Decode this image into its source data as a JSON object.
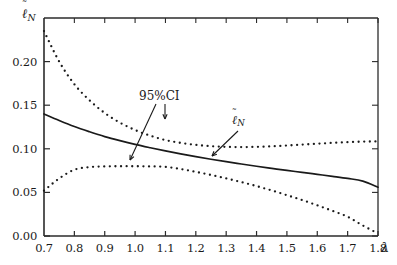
{
  "figure": {
    "background_color": "#ffffff",
    "axis_color": "#2b2b2b",
    "curve_color": "#1a1a1a"
  },
  "axes": {
    "x": {
      "name": "λ",
      "min": 0.7,
      "max": 1.8,
      "tick_values": [
        0.7,
        0.8,
        0.9,
        1.0,
        1.1,
        1.2,
        1.3,
        1.4,
        1.5,
        1.6,
        1.7,
        1.8
      ],
      "tick_labels": [
        "0.7",
        "0.8",
        "0.9",
        "1.0",
        "1.1",
        "1.2",
        "1.3",
        "1.4",
        "1.5",
        "1.6",
        "1.7",
        "1.8"
      ]
    },
    "y": {
      "name_ell": "ℓ",
      "name_tilde": "˜",
      "name_sub": "N",
      "min": 0.0,
      "max": 0.25,
      "tick_values": [
        0.0,
        0.05,
        0.1,
        0.15,
        0.2
      ],
      "tick_labels": [
        "0.00",
        "0.05",
        "0.10",
        "0.15",
        "0.20"
      ]
    }
  },
  "annotations": {
    "ci": {
      "text": "95%CI",
      "x_px": 139,
      "y_px": 89
    },
    "ell": {
      "ell": "ℓ",
      "tilde": "˜",
      "sub": "N",
      "x_px": 232,
      "y_px": 113
    }
  },
  "chart_data": {
    "type": "line",
    "title": "",
    "xlabel": "λ",
    "ylabel": "ℓ̃_N",
    "xlim": [
      0.7,
      1.8
    ],
    "ylim": [
      0.0,
      0.25
    ],
    "grid": false,
    "legend": "annotated in-plot",
    "x": [
      0.7,
      0.75,
      0.8,
      0.85,
      0.9,
      0.95,
      1.0,
      1.05,
      1.1,
      1.15,
      1.2,
      1.25,
      1.3,
      1.35,
      1.4,
      1.45,
      1.5,
      1.55,
      1.6,
      1.65,
      1.7,
      1.75,
      1.8
    ],
    "series": [
      {
        "name": "ℓ̃_N (estimate)",
        "style": "solid",
        "values": [
          0.14,
          0.1325,
          0.1255,
          0.1195,
          0.114,
          0.1093,
          0.105,
          0.1012,
          0.0976,
          0.0942,
          0.091,
          0.088,
          0.0852,
          0.0826,
          0.08,
          0.0776,
          0.0752,
          0.073,
          0.0707,
          0.0684,
          0.066,
          0.063,
          0.056
        ]
      },
      {
        "name": "95%CI upper",
        "style": "dotted",
        "values": [
          0.235,
          0.2,
          0.174,
          0.1555,
          0.141,
          0.13,
          0.1215,
          0.115,
          0.11,
          0.1068,
          0.1045,
          0.103,
          0.1022,
          0.102,
          0.1022,
          0.1028,
          0.1038,
          0.1048,
          0.1058,
          0.1068,
          0.1076,
          0.1082,
          0.1085
        ]
      },
      {
        "name": "95%CI lower",
        "style": "dotted",
        "values": [
          0.052,
          0.066,
          0.076,
          0.079,
          0.0798,
          0.08,
          0.08,
          0.0798,
          0.0793,
          0.0768,
          0.0735,
          0.07,
          0.066,
          0.0618,
          0.0572,
          0.0522,
          0.0468,
          0.0412,
          0.0352,
          0.0288,
          0.022,
          0.012,
          0.003
        ]
      }
    ]
  }
}
